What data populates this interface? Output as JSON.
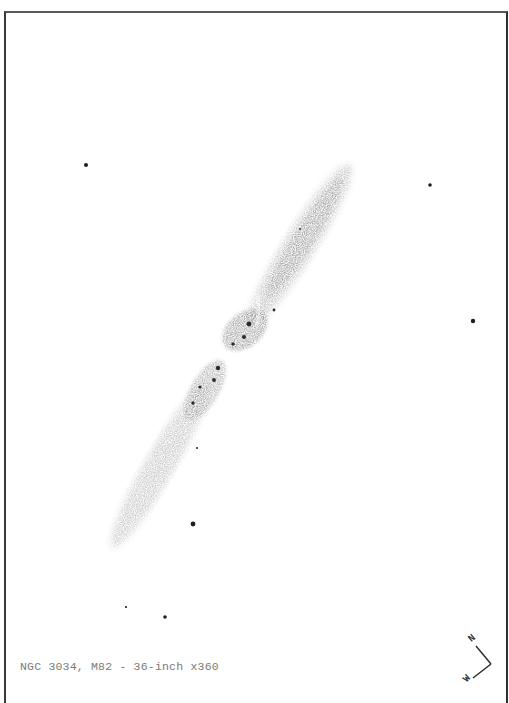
{
  "caption": "NGC 3034, M82 - 36-inch x360",
  "compass": {
    "north_label": "N",
    "west_label": "W"
  },
  "colors": {
    "paper": "#ffffff",
    "frame": "#333333",
    "ink": "#1e1e1e",
    "nebulosity": "#777777",
    "caption": "#7a7a7a"
  },
  "galaxy": {
    "name": "M82",
    "designation": "NGC 3034",
    "orientation": "edge-on, tilted ~55deg from horizontal, NE to SW"
  },
  "field_stars": [
    {
      "x": 86,
      "y": 165,
      "r": 2.0
    },
    {
      "x": 430,
      "y": 185,
      "r": 1.8
    },
    {
      "x": 473,
      "y": 321,
      "r": 2.2
    },
    {
      "x": 193,
      "y": 524,
      "r": 2.4
    },
    {
      "x": 197,
      "y": 448,
      "r": 1.0
    },
    {
      "x": 126,
      "y": 607,
      "r": 1.1
    },
    {
      "x": 165,
      "y": 617,
      "r": 1.8
    }
  ],
  "knots": [
    {
      "x": 249,
      "y": 324,
      "r": 2.4
    },
    {
      "x": 244,
      "y": 337,
      "r": 2.0
    },
    {
      "x": 233,
      "y": 344,
      "r": 1.7
    },
    {
      "x": 218,
      "y": 368,
      "r": 2.2
    },
    {
      "x": 214,
      "y": 380,
      "r": 1.9
    },
    {
      "x": 200,
      "y": 387,
      "r": 1.6
    },
    {
      "x": 193,
      "y": 403,
      "r": 1.7
    },
    {
      "x": 274,
      "y": 310,
      "r": 1.4
    },
    {
      "x": 300,
      "y": 229,
      "r": 0.9
    }
  ]
}
